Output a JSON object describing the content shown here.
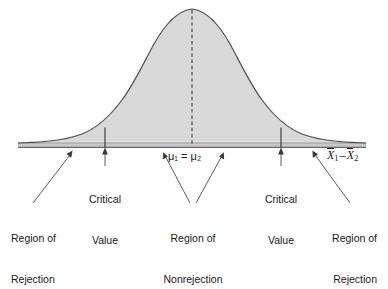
{
  "figure": {
    "type": "normal-distribution-two-tailed-hypothesis-test",
    "background_color": "#ffffff",
    "curve": {
      "fill_color": "#d9d9d9",
      "stroke_color": "#4d4d4d",
      "peak_x": 192,
      "baseline_y": 144
    },
    "center_dashed_line": {
      "color": "#333333",
      "x": 192,
      "style": "dashed"
    },
    "critical_lines": [
      {
        "name": "left-critical-line",
        "x": 105
      },
      {
        "name": "right-critical-line",
        "x": 281
      }
    ]
  },
  "labels": {
    "center_mu": "μ₁ = μ₂",
    "axis_label": "X̄1 − X̄2",
    "axis_label_parts": {
      "first_var": "X",
      "first_sub": "1",
      "minus": "–",
      "second_var": "X",
      "second_sub": "2"
    },
    "critical_value_left": "Critical\nValue",
    "critical_value_right": "Critical\nValue",
    "critical_value_line1": "Critical",
    "critical_value_line2": "Value",
    "region_of_rejection_left_line1": "Region of",
    "region_of_rejection_left_line2": "Rejection",
    "region_of_nonrejection_line1": "Region of",
    "region_of_nonrejection_line2": "Nonrejection",
    "region_of_rejection_right_line1": "Region of",
    "region_of_rejection_right_line2": "Rejection"
  },
  "colors": {
    "curve_fill": "#d9d9d9",
    "curve_stroke": "#4d4d4d",
    "text": "#1a1a1a",
    "leader_line": "#555555",
    "baseline": "#3f3f3f"
  }
}
